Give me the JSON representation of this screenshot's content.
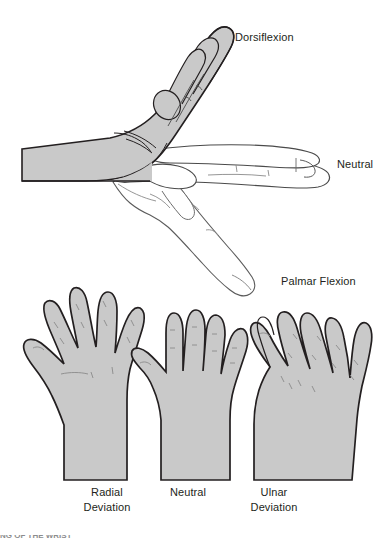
{
  "figure": {
    "title_alt": "Wrist range of motion",
    "background_color": "#ffffff",
    "skin_fill_color": "#c9c9c9",
    "outline_color": "#231f20",
    "crease_color": "#8a8a8a",
    "label_color": "#231f20"
  },
  "lateral_view": {
    "caption_dorsiflexion": "Dorsiflexion",
    "caption_neutral": "Neutral",
    "caption_palmar_flexion": "Palmar Flexion"
  },
  "dorsal_view": {
    "hands": [
      {
        "line1": "Radial",
        "line2": "Deviation"
      },
      {
        "line1": "Neutral",
        "line2": ""
      },
      {
        "line1": "Ulnar",
        "line2": "Deviation"
      }
    ]
  },
  "footer": {
    "cropped_text": "NG OF THE WRIST"
  }
}
